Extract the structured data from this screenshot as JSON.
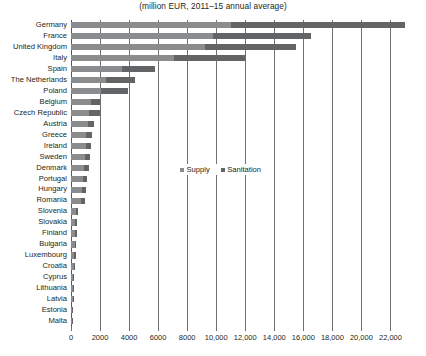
{
  "chart_data": {
    "type": "bar",
    "orientation": "horizontal",
    "stacked": true,
    "title": "(million EUR, 2011–15 annual average)",
    "xlabel": "",
    "ylabel": "",
    "xlim": [
      0,
      23000
    ],
    "grid": true,
    "legend_position": "center",
    "xticks": [
      0,
      2000,
      4000,
      6000,
      8000,
      10000,
      12000,
      14000,
      16000,
      18000,
      20000,
      22000
    ],
    "xticklabels": [
      "0",
      "2000",
      "4000",
      "6000",
      "8000",
      "10,000",
      "12,000",
      "14,000",
      "16,000",
      "18,000",
      "20,000",
      "22,000"
    ],
    "categories": [
      "Germany",
      "France",
      "United Kingdom",
      "Italy",
      "Spain",
      "The Netherlands",
      "Poland",
      "Belgium",
      "Czech Republic",
      "Austria",
      "Greece",
      "Ireland",
      "Sweden",
      "Denmark",
      "Portugal",
      "Hungary",
      "Romania",
      "Slovenia",
      "Slovakia",
      "Finland",
      "Bulgaria",
      "Luxembourg",
      "Croatia",
      "Cyprus",
      "Lithuania",
      "Latvia",
      "Estonia",
      "Malta"
    ],
    "series": [
      {
        "name": "Supply",
        "color": "#8a8c8e",
        "values": [
          11000,
          9800,
          9200,
          7100,
          3500,
          2400,
          2100,
          1400,
          1250,
          1150,
          1050,
          1000,
          950,
          900,
          800,
          760,
          720,
          330,
          300,
          280,
          250,
          230,
          200,
          150,
          130,
          110,
          90,
          45
        ]
      },
      {
        "name": "Sanitation",
        "color": "#636466",
        "values": [
          12000,
          6700,
          6300,
          4900,
          2300,
          2000,
          1800,
          600,
          750,
          450,
          400,
          380,
          350,
          330,
          290,
          260,
          240,
          140,
          130,
          120,
          110,
          100,
          85,
          60,
          55,
          45,
          35,
          20
        ]
      }
    ],
    "totals": [
      23000,
      16500,
      15500,
      12000,
      5800,
      4400,
      3900,
      2000,
      2000,
      1600,
      1450,
      1380,
      1300,
      1230,
      1090,
      1020,
      960,
      470,
      430,
      400,
      360,
      330,
      285,
      210,
      185,
      155,
      125,
      65
    ]
  },
  "legend": {
    "items": [
      {
        "label": "Supply"
      },
      {
        "label": "Sanitation"
      }
    ]
  }
}
